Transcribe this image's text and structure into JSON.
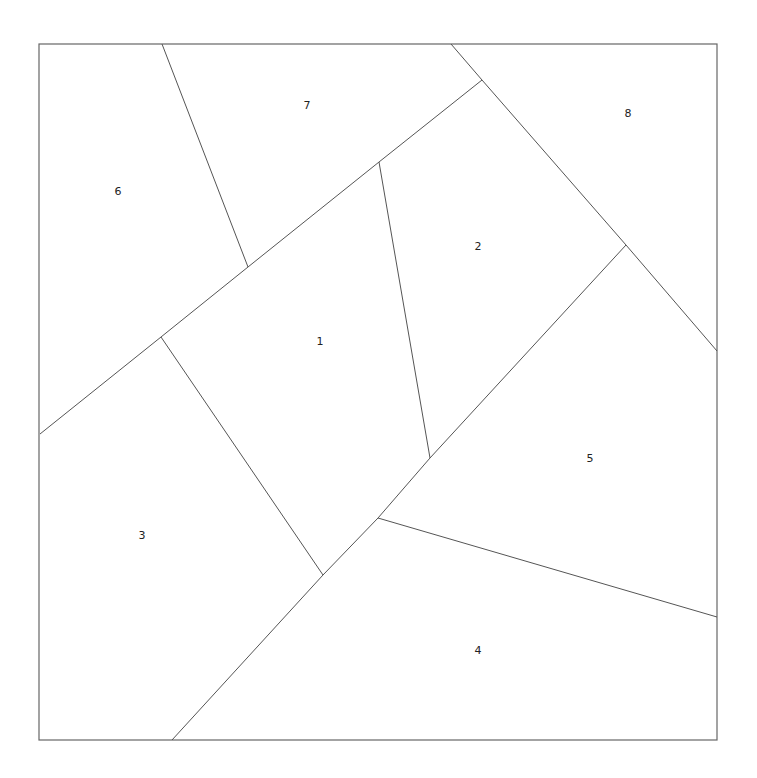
{
  "diagram": {
    "type": "polygon-partition",
    "border": {
      "x1": 39,
      "y1": 44,
      "x2": 717,
      "y2": 740
    },
    "segments": [
      {
        "id": "a",
        "points": [
          [
            162,
            44
          ],
          [
            248,
            267
          ]
        ]
      },
      {
        "id": "b",
        "points": [
          [
            40,
            434
          ],
          [
            161,
            337
          ],
          [
            248,
            267
          ],
          [
            379,
            162
          ],
          [
            482,
            80
          ]
        ]
      },
      {
        "id": "c",
        "points": [
          [
            451,
            44
          ],
          [
            482,
            80
          ],
          [
            626,
            245
          ],
          [
            717,
            351
          ]
        ]
      },
      {
        "id": "d",
        "points": [
          [
            379,
            162
          ],
          [
            430,
            458
          ]
        ]
      },
      {
        "id": "e",
        "points": [
          [
            626,
            245
          ],
          [
            430,
            458
          ],
          [
            378,
            518
          ],
          [
            323,
            575
          ],
          [
            172,
            740
          ]
        ]
      },
      {
        "id": "f",
        "points": [
          [
            161,
            337
          ],
          [
            323,
            575
          ]
        ]
      },
      {
        "id": "g",
        "points": [
          [
            378,
            518
          ],
          [
            717,
            617
          ]
        ]
      }
    ],
    "regions": [
      {
        "label": "1",
        "x": 320,
        "y": 342
      },
      {
        "label": "2",
        "x": 478,
        "y": 247
      },
      {
        "label": "3",
        "x": 142,
        "y": 536
      },
      {
        "label": "4",
        "x": 478,
        "y": 651
      },
      {
        "label": "5",
        "x": 590,
        "y": 459
      },
      {
        "label": "6",
        "x": 118,
        "y": 192
      },
      {
        "label": "7",
        "x": 307,
        "y": 106
      },
      {
        "label": "8",
        "x": 628,
        "y": 114
      }
    ],
    "colors": {
      "line": "#555555",
      "text": "#222222",
      "background": "#ffffff"
    }
  }
}
